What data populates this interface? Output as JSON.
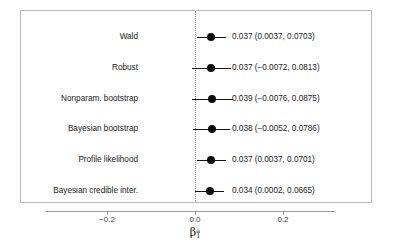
{
  "chart_data": {
    "type": "scatter",
    "subtype": "forest-plot",
    "title": "",
    "xlabel": "β₁ᵃ",
    "xlabel_parts": {
      "base": "β",
      "sub": "1",
      "sup": "a"
    },
    "ylabel": "",
    "xlim": [
      -0.29,
      0.115
    ],
    "xticks": [
      -0.2,
      0.0,
      0.2
    ],
    "xtick_labels": [
      "−0.2",
      "0.0",
      "0.2"
    ],
    "reference_line": {
      "x": 0.0,
      "style": "dotted"
    },
    "grid": false,
    "legend": false,
    "categories": [
      "Wald",
      "Robust",
      "Nonparam. bootstrap",
      "Bayesian bootstrap",
      "Profile likelihood",
      "Bayesian credible inter."
    ],
    "estimates": [
      0.037,
      0.037,
      0.039,
      0.038,
      0.037,
      0.034
    ],
    "ci_lower": [
      0.0037,
      -0.0072,
      -0.0076,
      -0.0052,
      0.0037,
      0.0002
    ],
    "ci_upper": [
      0.0703,
      0.0813,
      0.0875,
      0.0786,
      0.0701,
      0.0665
    ],
    "rows": [
      {
        "label": "Wald",
        "estimate": 0.037,
        "lower": 0.0037,
        "upper": 0.0703,
        "value_text": "0.037 (0.0037, 0.0703)"
      },
      {
        "label": "Robust",
        "estimate": 0.037,
        "lower": -0.0072,
        "upper": 0.0813,
        "value_text": "0.037 (−0.0072, 0.0813)"
      },
      {
        "label": "Nonparam. bootstrap",
        "estimate": 0.039,
        "lower": -0.0076,
        "upper": 0.0875,
        "value_text": "0.039 (−0.0076, 0.0875)"
      },
      {
        "label": "Bayesian bootstrap",
        "estimate": 0.038,
        "lower": -0.0052,
        "upper": 0.0786,
        "value_text": "0.038 (−0.0052, 0.0786)"
      },
      {
        "label": "Profile likelihood",
        "estimate": 0.037,
        "lower": 0.0037,
        "upper": 0.0701,
        "value_text": "0.037 (0.0037, 0.0701)"
      },
      {
        "label": "Bayesian credible inter.",
        "estimate": 0.034,
        "lower": 0.0002,
        "upper": 0.0665,
        "value_text": "0.034 (0.0002, 0.0665)"
      }
    ],
    "colors": {
      "point": "#0b0b0b",
      "bar": "#111111",
      "frame": "#b9b9b9",
      "reference": "#8a8a8a",
      "text": "#1a1a1a"
    }
  }
}
